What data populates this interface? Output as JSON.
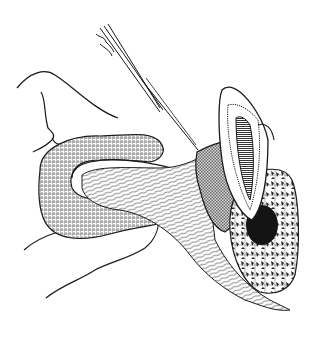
{
  "illustration": {
    "kind": "pen-and-ink anatomical drawing",
    "subject": "sectioned tooth in alveolar bone with retracted soft-tissue flap and surgical instrument",
    "labels": [],
    "colors": {
      "background": "#ffffff",
      "ink": "#1a1a1a",
      "hatch_gray": "#8a8a8a",
      "bone_dark": "#141414"
    }
  }
}
